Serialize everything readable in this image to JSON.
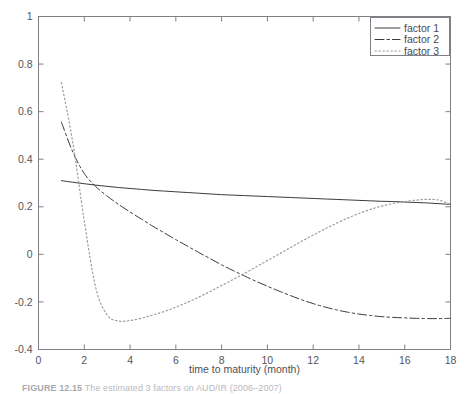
{
  "figure": {
    "caption_label": "FIGURE 12.15",
    "caption_text": "The estimated 3 factors on AUD/IR (2006–2007)"
  },
  "chart_data": {
    "type": "line",
    "title": "",
    "xlabel": "time to maturity (month)",
    "ylabel": "",
    "xlim": [
      0,
      18
    ],
    "ylim": [
      -0.4,
      1
    ],
    "xticks": [
      0,
      2,
      4,
      6,
      8,
      10,
      12,
      14,
      16,
      18
    ],
    "xtick_labels": [
      "0",
      "2",
      "4",
      "6",
      "8",
      "10",
      "12",
      "14",
      "16",
      "18"
    ],
    "yticks": [
      -0.4,
      -0.2,
      0,
      0.2,
      0.4,
      0.6,
      0.8,
      1
    ],
    "ytick_labels": [
      "-0.4",
      "-0.2",
      "0",
      "0.2",
      "0.4",
      "0.6",
      "0.8",
      "1"
    ],
    "grid": false,
    "legend_position": "upper right",
    "x": [
      1,
      1.5,
      2,
      2.5,
      3,
      3.5,
      4,
      4.5,
      5,
      5.5,
      6,
      6.5,
      7,
      7.5,
      8,
      8.5,
      9,
      9.5,
      10,
      10.5,
      11,
      11.5,
      12,
      12.5,
      13,
      13.5,
      14,
      14.5,
      15,
      15.5,
      16,
      16.5,
      17,
      17.5,
      18
    ],
    "series": [
      {
        "name": "factor 1",
        "linestyle": "solid",
        "color": "#3c3c3c",
        "values": [
          0.31,
          0.303,
          0.297,
          0.291,
          0.286,
          0.281,
          0.277,
          0.273,
          0.269,
          0.266,
          0.263,
          0.26,
          0.257,
          0.254,
          0.251,
          0.249,
          0.247,
          0.245,
          0.243,
          0.241,
          0.239,
          0.237,
          0.235,
          0.233,
          0.231,
          0.229,
          0.227,
          0.225,
          0.223,
          0.222,
          0.22,
          0.218,
          0.216,
          0.213,
          0.21
        ]
      },
      {
        "name": "factor 2",
        "linestyle": "dashdot",
        "color": "#3c3c3c",
        "values": [
          0.556,
          0.43,
          0.34,
          0.285,
          0.245,
          0.21,
          0.178,
          0.148,
          0.118,
          0.09,
          0.062,
          0.035,
          0.008,
          -0.018,
          -0.044,
          -0.068,
          -0.091,
          -0.113,
          -0.134,
          -0.154,
          -0.173,
          -0.191,
          -0.207,
          -0.221,
          -0.233,
          -0.243,
          -0.251,
          -0.257,
          -0.262,
          -0.265,
          -0.267,
          -0.269,
          -0.27,
          -0.27,
          -0.269
        ]
      },
      {
        "name": "factor 3",
        "linestyle": "dotted",
        "color": "#9a9aa0",
        "values": [
          0.722,
          0.47,
          0.14,
          -0.14,
          -0.255,
          -0.28,
          -0.278,
          -0.268,
          -0.255,
          -0.24,
          -0.222,
          -0.202,
          -0.18,
          -0.156,
          -0.131,
          -0.106,
          -0.08,
          -0.053,
          -0.026,
          0.001,
          0.028,
          0.055,
          0.081,
          0.106,
          0.13,
          0.152,
          0.172,
          0.189,
          0.203,
          0.214,
          0.222,
          0.228,
          0.231,
          0.228,
          0.21
        ]
      }
    ],
    "legend": [
      {
        "label": "factor 1",
        "linestyle": "solid"
      },
      {
        "label": "factor 2",
        "linestyle": "dashdot"
      },
      {
        "label": "factor 3",
        "linestyle": "dotted"
      }
    ]
  }
}
